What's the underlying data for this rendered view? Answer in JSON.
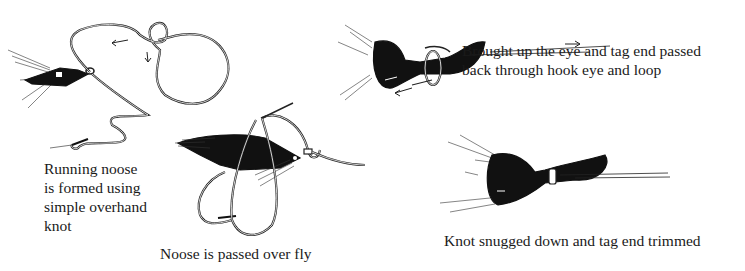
{
  "diagram": {
    "steps": [
      {
        "id": 1,
        "caption": "Running noose\nis formed using\nsimple overhand\nknot"
      },
      {
        "id": 2,
        "caption": "Noose is passed over fly"
      },
      {
        "id": 3,
        "caption": "Brought up the eye and tag end passed\nback through hook eye and loop"
      },
      {
        "id": 4,
        "caption": "Knot snugged down and tag end trimmed"
      }
    ]
  }
}
